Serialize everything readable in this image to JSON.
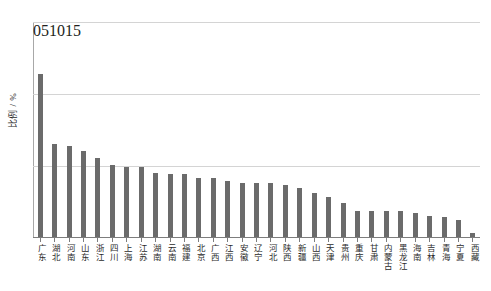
{
  "chart_data": {
    "type": "bar",
    "title": "",
    "xlabel": "",
    "ylabel": "比例 / %",
    "ylim": [
      0,
      15
    ],
    "yticks": [
      0,
      5,
      10,
      15
    ],
    "ytick_labels": [
      "0",
      "5",
      "10",
      "15"
    ],
    "grid": true,
    "legend": "none",
    "bar_color": "#6b6b6b",
    "categories": [
      "广东",
      "湖北",
      "河南",
      "山东",
      "浙江",
      "四川",
      "上海",
      "江苏",
      "湖南",
      "云南",
      "福建",
      "北京",
      "广西",
      "江西",
      "安徽",
      "辽宁",
      "河北",
      "陕西",
      "新疆",
      "山西",
      "天津",
      "贵州",
      "重庆",
      "甘肃",
      "内蒙古",
      "黑龙江",
      "海南",
      "吉林",
      "青海",
      "宁夏",
      "西藏"
    ],
    "values": [
      11.35,
      6.5,
      6.35,
      6.0,
      5.5,
      5.0,
      4.9,
      4.9,
      4.5,
      4.4,
      4.4,
      4.1,
      4.1,
      3.9,
      3.8,
      3.8,
      3.8,
      3.6,
      3.4,
      3.1,
      2.8,
      2.4,
      1.8,
      1.8,
      1.8,
      1.8,
      1.7,
      1.5,
      1.4,
      1.2,
      0.3
    ]
  }
}
